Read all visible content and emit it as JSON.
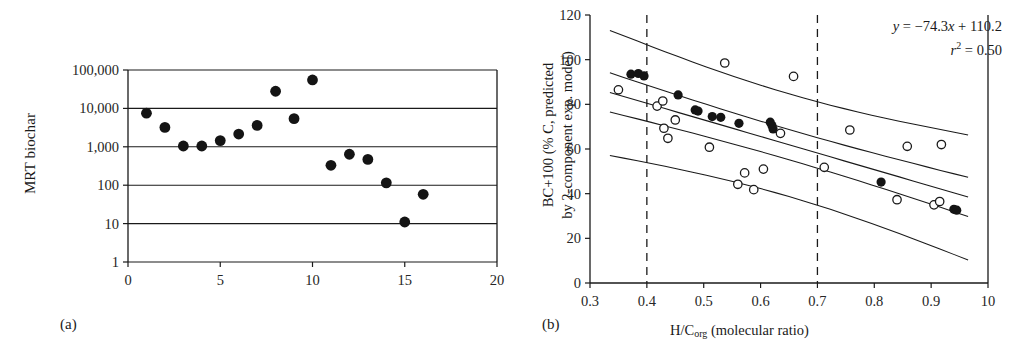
{
  "figure": {
    "panels": [
      {
        "tag": "(a)",
        "y_axis_label": "MRT biochar",
        "x_axis_label": ""
      },
      {
        "tag": "(b)",
        "y_axis_label_line1": "BC+100 (% C, predicted",
        "y_axis_label_line2": "by 2-component exp. model)",
        "x_axis_label_prefix": "H/C",
        "x_axis_label_sub": "org",
        "x_axis_label_suffix": " (molecular ratio)",
        "equation": "y = −74.3x + 110.2",
        "r_squared": "r2 = 0.50",
        "r_squared_value": "0.50",
        "slope": "-74.3",
        "intercept": "110.2"
      }
    ],
    "colors": {
      "axis": "#1a1a1a",
      "grid": "#1a1a1a",
      "filled_marker": "#141414",
      "open_marker_stroke": "#1a1a1a",
      "open_marker_fill": "#ffffff",
      "dashed_reference": "#1a1a1a",
      "background": "#ffffff"
    }
  },
  "chart_data": [
    {
      "type": "scatter",
      "panel": "a",
      "title": "",
      "xlabel": "",
      "ylabel": "MRT biochar",
      "xlim": [
        0,
        20
      ],
      "ylim": [
        1,
        100000
      ],
      "yscale": "log",
      "xticks": [
        0,
        5,
        10,
        15,
        20
      ],
      "yticks": [
        1,
        10,
        100,
        1000,
        10000,
        100000
      ],
      "ytick_labels": [
        "1",
        "10",
        "100",
        "1,000",
        "10,000",
        "100,000"
      ],
      "xtick_labels": [
        "0",
        "5",
        "10",
        "15",
        "20"
      ],
      "grid": "horizontal",
      "legend": "none",
      "marker": "filled-circle",
      "points": [
        {
          "x": 1,
          "y": 7500
        },
        {
          "x": 2,
          "y": 3200
        },
        {
          "x": 3,
          "y": 1050
        },
        {
          "x": 4,
          "y": 1050
        },
        {
          "x": 5,
          "y": 1450
        },
        {
          "x": 6,
          "y": 2150
        },
        {
          "x": 7,
          "y": 3600
        },
        {
          "x": 8,
          "y": 28000
        },
        {
          "x": 9,
          "y": 5400
        },
        {
          "x": 10,
          "y": 55000
        },
        {
          "x": 11,
          "y": 330
        },
        {
          "x": 12,
          "y": 640
        },
        {
          "x": 13,
          "y": 470
        },
        {
          "x": 14,
          "y": 115
        },
        {
          "x": 15,
          "y": 11
        },
        {
          "x": 16,
          "y": 58
        }
      ]
    },
    {
      "type": "scatter",
      "panel": "b",
      "title": "",
      "xlabel": "H/Corg (molecular ratio)",
      "ylabel": "BC+100 (% C, predicted by 2-component exp. model)",
      "xlim": [
        0.3,
        1.0
      ],
      "ylim": [
        0,
        120
      ],
      "xticks": [
        0.3,
        0.4,
        0.5,
        0.6,
        0.7,
        0.8,
        0.9,
        1.0
      ],
      "xtick_labels": [
        "0.3",
        "0.4",
        "0.5",
        "0.6",
        "0.7",
        "0.8",
        "0.9",
        "10"
      ],
      "yticks": [
        0,
        20,
        40,
        60,
        80,
        100,
        120
      ],
      "ytick_labels": [
        "0",
        "20",
        "40",
        "60",
        "80",
        "100",
        "120"
      ],
      "grid": "none",
      "legend": "none",
      "annotations": [
        "y = -74.3x + 110.2",
        "r2 = 0.50"
      ],
      "reference_lines": [
        {
          "type": "vertical-dashed",
          "x": 0.4
        },
        {
          "type": "vertical-dashed",
          "x": 0.7
        }
      ],
      "regression": {
        "slope": -74.3,
        "intercept": 110.2,
        "r2": 0.5
      },
      "bands": [
        {
          "name": "upper-prediction",
          "intercept": 138.0,
          "slope": -74.3
        },
        {
          "name": "upper-confidence",
          "intercept": 119.0,
          "slope": -74.3
        },
        {
          "name": "fit",
          "intercept": 110.2,
          "slope": -74.3
        },
        {
          "name": "lower-confidence",
          "intercept": 101.5,
          "slope": -74.3
        },
        {
          "name": "lower-prediction",
          "intercept": 82.0,
          "slope": -74.3
        }
      ],
      "series": [
        {
          "name": "filled-circles",
          "marker": "filled-circle",
          "points": [
            {
              "x": 0.372,
              "y": 93.5
            },
            {
              "x": 0.385,
              "y": 93.8
            },
            {
              "x": 0.395,
              "y": 92.7
            },
            {
              "x": 0.455,
              "y": 84.2
            },
            {
              "x": 0.485,
              "y": 77.5
            },
            {
              "x": 0.49,
              "y": 77.0
            },
            {
              "x": 0.515,
              "y": 74.5
            },
            {
              "x": 0.53,
              "y": 74.2
            },
            {
              "x": 0.562,
              "y": 71.5
            },
            {
              "x": 0.617,
              "y": 72.0
            },
            {
              "x": 0.62,
              "y": 70.5
            },
            {
              "x": 0.622,
              "y": 69.0
            },
            {
              "x": 0.812,
              "y": 45.2
            },
            {
              "x": 0.94,
              "y": 33.0
            },
            {
              "x": 0.945,
              "y": 32.6
            }
          ]
        },
        {
          "name": "open-circles",
          "marker": "open-circle",
          "points": [
            {
              "x": 0.35,
              "y": 86.5
            },
            {
              "x": 0.418,
              "y": 79.2
            },
            {
              "x": 0.428,
              "y": 81.5
            },
            {
              "x": 0.43,
              "y": 69.3
            },
            {
              "x": 0.437,
              "y": 64.8
            },
            {
              "x": 0.45,
              "y": 73.0
            },
            {
              "x": 0.51,
              "y": 60.8
            },
            {
              "x": 0.537,
              "y": 98.5
            },
            {
              "x": 0.56,
              "y": 44.2
            },
            {
              "x": 0.572,
              "y": 49.3
            },
            {
              "x": 0.588,
              "y": 41.8
            },
            {
              "x": 0.605,
              "y": 51.0
            },
            {
              "x": 0.635,
              "y": 67.0
            },
            {
              "x": 0.658,
              "y": 92.5
            },
            {
              "x": 0.712,
              "y": 51.8
            },
            {
              "x": 0.757,
              "y": 68.5
            },
            {
              "x": 0.858,
              "y": 61.2
            },
            {
              "x": 0.84,
              "y": 37.3
            },
            {
              "x": 0.905,
              "y": 35.0
            },
            {
              "x": 0.915,
              "y": 36.5
            },
            {
              "x": 0.918,
              "y": 62.0
            }
          ]
        }
      ]
    }
  ]
}
